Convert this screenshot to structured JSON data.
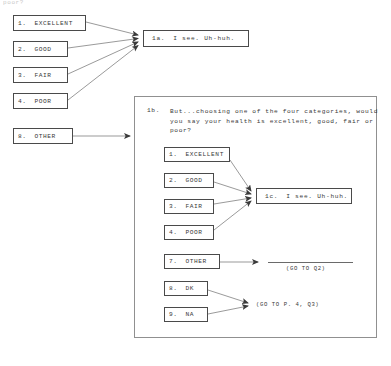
{
  "page": {
    "cut_off_top_text": "poor?",
    "background_color": "#ffffff",
    "line_color": "#4a4a4a"
  },
  "outer_flow": {
    "options": [
      {
        "number": "1.",
        "label": "EXCELLENT"
      },
      {
        "number": "2.",
        "label": "GOOD"
      },
      {
        "number": "3.",
        "label": "FAIR"
      },
      {
        "number": "4.",
        "label": "POOR"
      }
    ],
    "other_option": {
      "number": "8.",
      "label": "OTHER"
    },
    "response_box": {
      "number": "1a.",
      "text": "I see.  Uh-huh."
    }
  },
  "inner_panel": {
    "question": {
      "number": "1b.",
      "line1": "But...choosing one of the four categories, would",
      "line2": "you say your health is excellent, good, fair or",
      "line3": "poor?"
    },
    "options": [
      {
        "number": "1.",
        "label": "EXCELLENT"
      },
      {
        "number": "2.",
        "label": "GOOD"
      },
      {
        "number": "3.",
        "label": "FAIR"
      },
      {
        "number": "4.",
        "label": "POOR"
      }
    ],
    "response_box": {
      "number": "1c.",
      "text": "I see.  Uh-huh."
    },
    "other_options": [
      {
        "number": "7.",
        "label": "OTHER"
      },
      {
        "number": "8.",
        "label": "DK"
      },
      {
        "number": "9.",
        "label": "NA"
      }
    ],
    "skip_notes": {
      "other_note": "(GO TO Q2)",
      "dk_na_note": "(GO TO P. 4, Q3)"
    }
  }
}
